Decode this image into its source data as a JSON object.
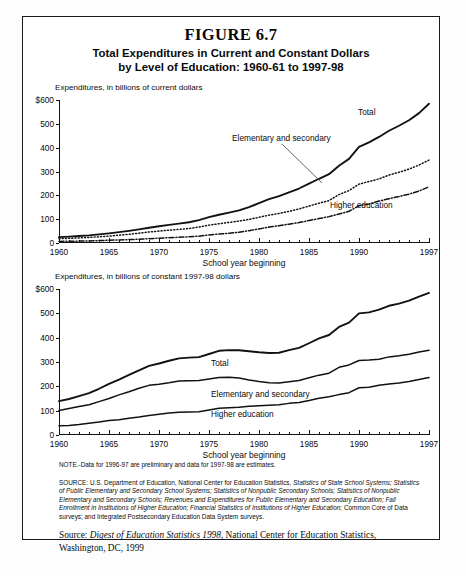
{
  "figure": {
    "number": "FIGURE 6.7",
    "title_line1": "Total Expenditures in Current and Constant Dollars",
    "title_line2": "by Level of Education: 1960-61 to 1997-98"
  },
  "chart_data": [
    {
      "type": "line",
      "id": "current-dollars",
      "title": "Expenditures, in billions of current dollars",
      "xlabel": "School year beginning",
      "ylabel": "",
      "xlim": [
        1960,
        1997
      ],
      "ylim": [
        0,
        600
      ],
      "yticks": [
        0,
        100,
        200,
        300,
        400,
        500,
        600
      ],
      "ytick_labels": [
        "0",
        "100",
        "200",
        "300",
        "400",
        "500",
        "$600"
      ],
      "xticks": [
        1960,
        1965,
        1970,
        1975,
        1980,
        1985,
        1990,
        1997
      ],
      "xtick_labels": [
        "1960",
        "1965",
        "1970",
        "1975",
        "1980",
        "1985",
        "1990",
        "1997"
      ],
      "grid": false,
      "legend": "inline-annotations",
      "x": [
        1960,
        1961,
        1962,
        1963,
        1964,
        1965,
        1966,
        1967,
        1968,
        1969,
        1970,
        1971,
        1972,
        1973,
        1974,
        1975,
        1976,
        1977,
        1978,
        1979,
        1980,
        1981,
        1982,
        1983,
        1984,
        1985,
        1986,
        1987,
        1988,
        1989,
        1990,
        1991,
        1992,
        1993,
        1994,
        1995,
        1996,
        1997
      ],
      "series": [
        {
          "name": "Total",
          "style": "solid",
          "values": [
            24.7,
            26.8,
            29.4,
            32.1,
            36.0,
            40.6,
            45.4,
            50.9,
            57.2,
            64.2,
            70.4,
            76.1,
            81.3,
            87.0,
            95.8,
            108.7,
            118.7,
            127.4,
            136.9,
            150.8,
            167.0,
            183.8,
            196.5,
            212.1,
            228.6,
            249.1,
            269.5,
            288.7,
            324.3,
            353.0,
            403.5,
            422.0,
            445.0,
            471.0,
            492.0,
            515.0,
            545.0,
            584.0
          ]
        },
        {
          "name": "Elementary and secondary",
          "style": "dotted",
          "values": [
            18.0,
            19.7,
            21.4,
            23.2,
            26.0,
            29.0,
            32.8,
            36.6,
            41.3,
            46.0,
            50.0,
            53.7,
            57.2,
            60.9,
            67.1,
            75.0,
            80.8,
            86.5,
            92.0,
            99.0,
            108.0,
            117.0,
            124.0,
            133.0,
            143.0,
            155.0,
            167.0,
            178.0,
            203.0,
            220.0,
            247.0,
            258.0,
            269.0,
            285.0,
            297.0,
            310.0,
            327.0,
            348.0
          ]
        },
        {
          "name": "Higher education",
          "style": "dashdot",
          "values": [
            6.7,
            7.1,
            8.0,
            8.9,
            10.0,
            11.6,
            12.6,
            14.3,
            15.9,
            18.2,
            20.4,
            22.4,
            24.1,
            26.1,
            28.7,
            33.7,
            37.9,
            40.9,
            44.9,
            51.8,
            59.0,
            66.8,
            72.5,
            79.1,
            85.6,
            94.1,
            102.5,
            110.7,
            121.3,
            133.0,
            156.5,
            164.0,
            176.0,
            186.0,
            195.0,
            205.0,
            218.0,
            236.0
          ]
        }
      ]
    },
    {
      "type": "line",
      "id": "constant-dollars",
      "title": "Expenditures, in billions of constant 1997-98 dollars",
      "xlabel": "School year beginning",
      "ylabel": "",
      "xlim": [
        1960,
        1997
      ],
      "ylim": [
        0,
        600
      ],
      "yticks": [
        0,
        100,
        200,
        300,
        400,
        500,
        600
      ],
      "ytick_labels": [
        "0",
        "100",
        "200",
        "300",
        "400",
        "500",
        "$600"
      ],
      "xticks": [
        1960,
        1965,
        1970,
        1975,
        1980,
        1985,
        1990,
        1997
      ],
      "xtick_labels": [
        "1960",
        "1965",
        "1970",
        "1975",
        "1980",
        "1985",
        "1990",
        "1997"
      ],
      "grid": false,
      "legend": "inline-annotations",
      "x": [
        1960,
        1961,
        1962,
        1963,
        1964,
        1965,
        1966,
        1967,
        1968,
        1969,
        1970,
        1971,
        1972,
        1973,
        1974,
        1975,
        1976,
        1977,
        1978,
        1979,
        1980,
        1981,
        1982,
        1983,
        1984,
        1985,
        1986,
        1987,
        1988,
        1989,
        1990,
        1991,
        1992,
        1993,
        1994,
        1995,
        1996,
        1997
      ],
      "series": [
        {
          "name": "Total",
          "style": "solid",
          "values": [
            139,
            148,
            160,
            172,
            190,
            210,
            228,
            247,
            266,
            284,
            294,
            305,
            315,
            318,
            320,
            333,
            346,
            349,
            348,
            344,
            340,
            337,
            338,
            349,
            358,
            377,
            397,
            411,
            444,
            462,
            500,
            504,
            515,
            531,
            540,
            552,
            569,
            584
          ]
        },
        {
          "name": "Elementary and secondary",
          "style": "solid",
          "values": [
            101,
            109,
            117,
            124,
            137,
            150,
            165,
            178,
            192,
            204,
            209,
            215,
            222,
            223,
            224,
            230,
            236,
            237,
            234,
            226,
            220,
            215,
            214,
            219,
            224,
            235,
            246,
            254,
            278,
            288,
            306,
            308,
            311,
            321,
            326,
            332,
            341,
            348
          ]
        },
        {
          "name": "Higher education",
          "style": "solid",
          "values": [
            38,
            39,
            43,
            48,
            53,
            60,
            63,
            69,
            74,
            80,
            85,
            90,
            93,
            95,
            96,
            103,
            110,
            112,
            114,
            118,
            120,
            122,
            124,
            130,
            134,
            142,
            151,
            157,
            166,
            174,
            194,
            196,
            204,
            210,
            214,
            220,
            228,
            236
          ]
        }
      ]
    }
  ],
  "notes": {
    "note": "NOTE.-Data for 1996-97 are preliminary and data for 1997-98 are estimates.",
    "source_label": "SOURCE:",
    "source_text_1": "U.S. Department of Education, National Center for Education Statistics,",
    "source_italic_1": "Statistics of State School Systems; Statistics of Public Elementary and Secondary School Systems; Statistics of Nonpublic Secondary Schools; Statistics of Nonpublic Elementary and Secondary Schools; Revenues and Expenditures for Public Elementary and Secondary Education; Fall Enrollment in Institutions of Higher Education; Financial Statistics of Institutions of Higher Education;",
    "source_text_2": "Common Core of Data surveys; and Integrated Postsecondary Education Data System surveys."
  },
  "digest": {
    "prefix": "Source: ",
    "italic": "Digest of Education Statistics 1998",
    "suffix": ", National Center for Education Statistics, Washington, DC, 1999"
  }
}
